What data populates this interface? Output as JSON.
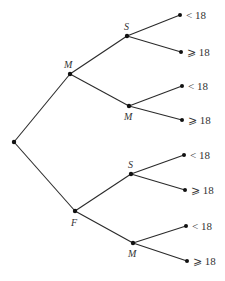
{
  "diagram": {
    "type": "tree",
    "root": {
      "id": "root",
      "x": 14,
      "y": 142,
      "label": ""
    },
    "nodes": [
      {
        "id": "m1",
        "x": 70,
        "y": 74,
        "label": "M",
        "label_x": 64,
        "label_y": 68,
        "parent": "root"
      },
      {
        "id": "f1",
        "x": 75,
        "y": 211,
        "label": "F",
        "label_x": 71,
        "label_y": 226,
        "parent": "root"
      },
      {
        "id": "s_m",
        "x": 127,
        "y": 36,
        "label": "S",
        "label_x": 124,
        "label_y": 30,
        "parent": "m1"
      },
      {
        "id": "m_m",
        "x": 129,
        "y": 106,
        "label": "M",
        "label_x": 124,
        "label_y": 120,
        "parent": "m1"
      },
      {
        "id": "s_f",
        "x": 131,
        "y": 174,
        "label": "S",
        "label_x": 128,
        "label_y": 168,
        "parent": "f1"
      },
      {
        "id": "m_f",
        "x": 133,
        "y": 243,
        "label": "M",
        "label_x": 128,
        "label_y": 257,
        "parent": "f1"
      }
    ],
    "leaves": [
      {
        "id": "l1",
        "x": 180,
        "y": 15,
        "label": "< 18",
        "parent": "s_m"
      },
      {
        "id": "l2",
        "x": 181,
        "y": 52,
        "label": "⩾ 18",
        "parent": "s_m"
      },
      {
        "id": "l3",
        "x": 182,
        "y": 86,
        "label": "< 18",
        "parent": "m_m"
      },
      {
        "id": "l4",
        "x": 182,
        "y": 120,
        "label": "⩾ 18",
        "parent": "m_m"
      },
      {
        "id": "l5",
        "x": 184,
        "y": 155,
        "label": "< 18",
        "parent": "s_f"
      },
      {
        "id": "l6",
        "x": 185,
        "y": 190,
        "label": "⩾ 18",
        "parent": "s_f"
      },
      {
        "id": "l7",
        "x": 186,
        "y": 226,
        "label": "< 18",
        "parent": "m_f"
      },
      {
        "id": "l8",
        "x": 187,
        "y": 261,
        "label": "⩾ 18",
        "parent": "m_f"
      }
    ]
  }
}
